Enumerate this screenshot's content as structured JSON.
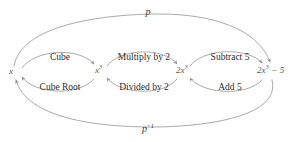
{
  "diagram": {
    "type": "function-machine-flow",
    "background_color": "#ffffff",
    "stroke_color": "#9a9a9a",
    "text_color": "#2e2e2e",
    "node_text_color": "#555555",
    "nodes": [
      {
        "id": "n0",
        "text": "x",
        "sup": "",
        "x": 14,
        "y": 72
      },
      {
        "id": "n1",
        "text": "x",
        "sup": "3",
        "x": 99,
        "y": 72
      },
      {
        "id": "n2",
        "text": "2x",
        "sup": "3",
        "x": 181,
        "y": 72
      },
      {
        "id": "n3",
        "text": "2x",
        "sup": "3",
        "suffix": " − 5",
        "x": 264,
        "y": 72
      }
    ],
    "forward_ops": [
      {
        "label": "Cube",
        "x": 60,
        "y": 53
      },
      {
        "label": "Multiply by 2",
        "x": 144,
        "y": 53
      },
      {
        "label": "Subtract 5",
        "x": 230,
        "y": 53
      }
    ],
    "inverse_ops": [
      {
        "label": "Cube Root",
        "x": 60,
        "y": 83
      },
      {
        "label": "Divided by 2",
        "x": 144,
        "y": 83
      },
      {
        "label": "Add 5",
        "x": 230,
        "y": 83
      }
    ],
    "outer_arcs": [
      {
        "id": "p",
        "label": "p",
        "sup": "",
        "x": 148,
        "y": 9,
        "direction": "left-to-right"
      },
      {
        "id": "p-inv",
        "label": "p",
        "sup": "−1",
        "x": 148,
        "y": 124,
        "direction": "right-to-left"
      }
    ]
  }
}
